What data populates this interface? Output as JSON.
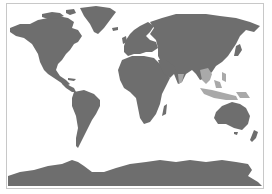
{
  "map": {
    "type": "world",
    "projection": "equirectangular",
    "background_color": "#ffffff",
    "land_color": "#6e6e6e",
    "highlight_color": "#a9a9a9",
    "border_color": "#c8c8c8",
    "highlighted_regions": [
      "India (south)",
      "Southeast Asia",
      "Maritime Southeast Asia / Indonesia",
      "Philippines",
      "Papua New Guinea"
    ],
    "continents": [
      "North America",
      "Greenland",
      "South America",
      "Europe",
      "Africa",
      "Asia",
      "Australia",
      "New Zealand",
      "Antarctica"
    ]
  }
}
